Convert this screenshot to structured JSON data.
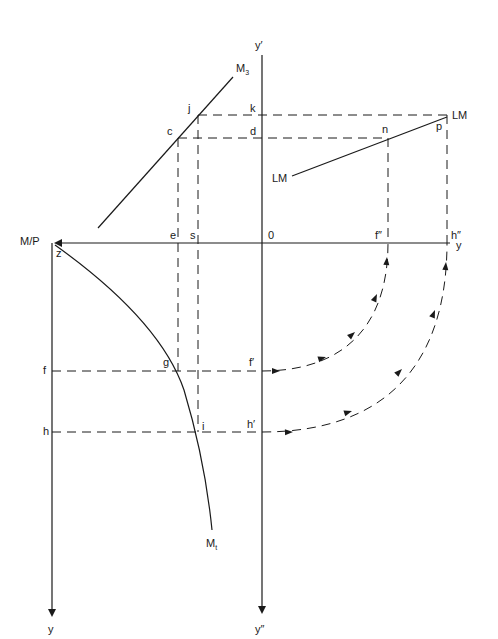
{
  "diagram": {
    "type": "four-quadrant IS-LM / money demand diagram",
    "axes": {
      "vertical_center_top": "y′",
      "vertical_center_bottom": "y″",
      "horizontal_left": "M/P",
      "horizontal_right": "y",
      "left_axis_bottom": "y",
      "origin": "0"
    },
    "curves": {
      "m3": "M",
      "m3_sub": "3",
      "mt": "M",
      "mt_sub": "t",
      "lm_top": "LM",
      "lm_left": "LM"
    },
    "points": {
      "j": "j",
      "k": "k",
      "c": "c",
      "d": "d",
      "n": "n",
      "p": "p",
      "e": "e",
      "s": "s",
      "f2": "f″",
      "h2": "h″",
      "z": "z",
      "f": "f",
      "g": "g",
      "f1": "f′",
      "h": "h",
      "i": "i",
      "h1": "h′"
    },
    "colors": {
      "ink": "#1a1a1a",
      "background": "#ffffff"
    }
  }
}
